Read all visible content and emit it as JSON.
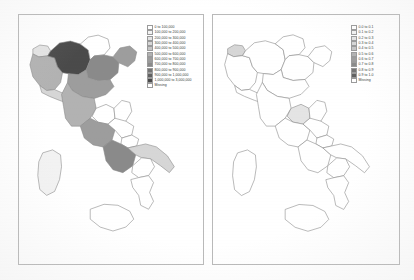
{
  "figure": {
    "background_color": "#ffffff",
    "panel_border_color": "#b9b9b9",
    "region_outline_color": "#8a8a8a"
  },
  "panels": [
    {
      "id": "left",
      "name": "italy-choropleth-population",
      "legend": {
        "missing_label": "Missing",
        "missing_color": "#ffffff",
        "entries": [
          {
            "label": "0 to 100,000",
            "color": "#ffffff"
          },
          {
            "label": "100,000 to 200,000",
            "color": "#f2f2f2"
          },
          {
            "label": "200,000 to 300,000",
            "color": "#e4e4e4"
          },
          {
            "label": "300,000 to 400,000",
            "color": "#d6d6d6"
          },
          {
            "label": "400,000 to 500,000",
            "color": "#c5c5c5"
          },
          {
            "label": "500,000 to 600,000",
            "color": "#b2b2b2"
          },
          {
            "label": "600,000 to 700,000",
            "color": "#9d9d9d"
          },
          {
            "label": "700,000 to 800,000",
            "color": "#8a8a8a"
          },
          {
            "label": "800,000 to 900,000",
            "color": "#757575"
          },
          {
            "label": "900,000 to 1,000,000",
            "color": "#616161"
          },
          {
            "label": "1,000,000 to 3,000,000",
            "color": "#4a4a4a"
          }
        ]
      }
    },
    {
      "id": "right",
      "name": "italy-choropleth-ratio",
      "legend": {
        "missing_label": "Missing",
        "missing_color": "#ffffff",
        "entries": [
          {
            "label": "0.0 to 0.1",
            "color": "#ffffff"
          },
          {
            "label": "0.1 to 0.2",
            "color": "#f2f2f2"
          },
          {
            "label": "0.2 to 0.3",
            "color": "#e4e4e4"
          },
          {
            "label": "0.3 to 0.4",
            "color": "#d6d6d6"
          },
          {
            "label": "0.4 to 0.5",
            "color": "#c5c5c5"
          },
          {
            "label": "0.5 to 0.6",
            "color": "#b2b2b2"
          },
          {
            "label": "0.6 to 0.7",
            "color": "#9d9d9d"
          },
          {
            "label": "0.7 to 0.8",
            "color": "#8a8a8a"
          },
          {
            "label": "0.8 to 0.9",
            "color": "#757575"
          },
          {
            "label": "0.9 to 1.0",
            "color": "#616161"
          }
        ]
      }
    }
  ],
  "chart_data": {
    "type": "map",
    "title": "",
    "subtitle": "",
    "projection": "regional outline of Italy including Sardinia and Sicily",
    "legend_position": "upper-right inside each panel",
    "grid": false,
    "panels": [
      {
        "name": "population",
        "units": "persons",
        "value_range": [
          0,
          3000000
        ],
        "bin_width": 100000,
        "regions": [
          {
            "region": "Valle d'Aosta",
            "fill": "#e4e4e4",
            "bin": "200,000 to 300,000"
          },
          {
            "region": "Piemonte",
            "fill": "#b2b2b2",
            "bin": "500,000 to 600,000"
          },
          {
            "region": "Liguria",
            "fill": "#d6d6d6",
            "bin": "300,000 to 400,000"
          },
          {
            "region": "Lombardia",
            "fill": "#4a4a4a",
            "bin": "1,000,000 to 3,000,000"
          },
          {
            "region": "Trentino-Alto Adige",
            "fill": "#ffffff",
            "bin": "Missing"
          },
          {
            "region": "Veneto",
            "fill": "#8a8a8a",
            "bin": "700,000 to 800,000"
          },
          {
            "region": "Friuli-Venezia Giulia",
            "fill": "#9d9d9d",
            "bin": "600,000 to 700,000"
          },
          {
            "region": "Emilia-Romagna",
            "fill": "#9d9d9d",
            "bin": "600,000 to 700,000"
          },
          {
            "region": "Toscana",
            "fill": "#b2b2b2",
            "bin": "500,000 to 600,000"
          },
          {
            "region": "Umbria",
            "fill": "#ffffff",
            "bin": "Missing"
          },
          {
            "region": "Marche",
            "fill": "#ffffff",
            "bin": "Missing"
          },
          {
            "region": "Lazio",
            "fill": "#9d9d9d",
            "bin": "600,000 to 700,000"
          },
          {
            "region": "Abruzzo",
            "fill": "#ffffff",
            "bin": "Missing"
          },
          {
            "region": "Molise",
            "fill": "#ffffff",
            "bin": "Missing"
          },
          {
            "region": "Campania",
            "fill": "#8a8a8a",
            "bin": "700,000 to 800,000"
          },
          {
            "region": "Puglia",
            "fill": "#d6d6d6",
            "bin": "300,000 to 400,000"
          },
          {
            "region": "Basilicata",
            "fill": "#ffffff",
            "bin": "Missing"
          },
          {
            "region": "Calabria",
            "fill": "#ffffff",
            "bin": "Missing"
          },
          {
            "region": "Sicilia",
            "fill": "#ffffff",
            "bin": "Missing"
          },
          {
            "region": "Sardegna",
            "fill": "#f2f2f2",
            "bin": "100,000 to 200,000"
          }
        ]
      },
      {
        "name": "ratio",
        "units": "ratio",
        "value_range": [
          0.0,
          1.0
        ],
        "bin_width": 0.1,
        "regions": [
          {
            "region": "Valle d'Aosta",
            "fill": "#d6d6d6",
            "bin": "0.3 to 0.4"
          },
          {
            "region": "Piemonte",
            "fill": "#ffffff",
            "bin": "Missing"
          },
          {
            "region": "Liguria",
            "fill": "#ffffff",
            "bin": "Missing"
          },
          {
            "region": "Lombardia",
            "fill": "#ffffff",
            "bin": "Missing"
          },
          {
            "region": "Trentino-Alto Adige",
            "fill": "#ffffff",
            "bin": "Missing"
          },
          {
            "region": "Veneto",
            "fill": "#ffffff",
            "bin": "Missing"
          },
          {
            "region": "Friuli-Venezia Giulia",
            "fill": "#ffffff",
            "bin": "Missing"
          },
          {
            "region": "Emilia-Romagna",
            "fill": "#ffffff",
            "bin": "Missing"
          },
          {
            "region": "Toscana",
            "fill": "#ffffff",
            "bin": "Missing"
          },
          {
            "region": "Umbria",
            "fill": "#e4e4e4",
            "bin": "0.2 to 0.3"
          },
          {
            "region": "Marche",
            "fill": "#ffffff",
            "bin": "Missing"
          },
          {
            "region": "Lazio",
            "fill": "#ffffff",
            "bin": "Missing"
          },
          {
            "region": "Abruzzo",
            "fill": "#ffffff",
            "bin": "Missing"
          },
          {
            "region": "Molise",
            "fill": "#ffffff",
            "bin": "Missing"
          },
          {
            "region": "Campania",
            "fill": "#ffffff",
            "bin": "Missing"
          },
          {
            "region": "Puglia",
            "fill": "#ffffff",
            "bin": "Missing"
          },
          {
            "region": "Basilicata",
            "fill": "#ffffff",
            "bin": "Missing"
          },
          {
            "region": "Calabria",
            "fill": "#ffffff",
            "bin": "Missing"
          },
          {
            "region": "Sicilia",
            "fill": "#ffffff",
            "bin": "Missing"
          },
          {
            "region": "Sardegna",
            "fill": "#ffffff",
            "bin": "Missing"
          }
        ]
      }
    ]
  }
}
